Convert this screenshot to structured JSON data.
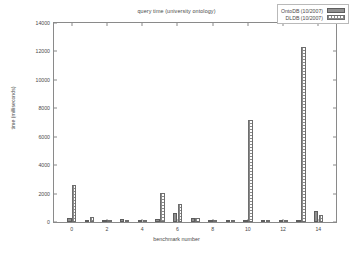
{
  "chart_data": {
    "type": "bar",
    "title": "query time (university ontology)",
    "xlabel": "benchmark number",
    "ylabel": "time (milliseconds)",
    "xlim": [
      -1,
      15
    ],
    "ylim": [
      0,
      14000
    ],
    "ytick_labels": [
      "0",
      "2000",
      "4000",
      "6000",
      "8000",
      "10000",
      "12000",
      "14000"
    ],
    "ytick_values": [
      0,
      2000,
      4000,
      6000,
      8000,
      10000,
      12000,
      14000
    ],
    "xtick_labels": [
      "0",
      "2",
      "4",
      "6",
      "8",
      "10",
      "12",
      "14"
    ],
    "xtick_values": [
      0,
      2,
      4,
      6,
      8,
      10,
      12,
      14
    ],
    "grid": false,
    "legend_position": "top-right",
    "categories": [
      0,
      1,
      2,
      3,
      4,
      5,
      6,
      7,
      8,
      9,
      10,
      11,
      12,
      13,
      14
    ],
    "series": [
      {
        "name": "OntoDB (10/2007)",
        "color": "#8f8f8f",
        "fill": "solid",
        "values": [
          300,
          150,
          20,
          180,
          10,
          200,
          660,
          280,
          10,
          10,
          60,
          10,
          40,
          140,
          760
        ]
      },
      {
        "name": "DLDB (10/2007)",
        "color": "#8a8a8a",
        "fill": "dotted",
        "values": [
          2570,
          330,
          20,
          110,
          10,
          2010,
          1290,
          250,
          10,
          10,
          7190,
          10,
          60,
          12330,
          460
        ]
      }
    ]
  },
  "legend": {
    "entries": [
      {
        "label": "OntoDB (10/2007)",
        "key": "solid-swatch"
      },
      {
        "label": "DLDB (10/2007)",
        "key": "dotted-swatch"
      }
    ]
  }
}
